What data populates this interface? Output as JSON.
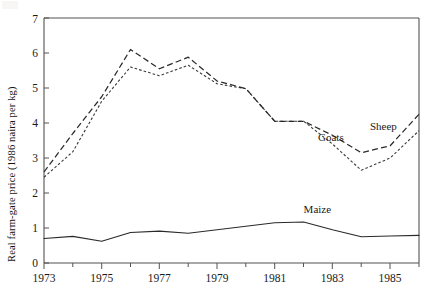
{
  "chart_data": {
    "type": "line",
    "title": "",
    "xlabel": "",
    "ylabel": "Real farm-gate price (1986 naira per kg)",
    "xlim": [
      1973,
      1986
    ],
    "ylim": [
      0,
      7
    ],
    "grid": false,
    "legend_position": "inline-annotations",
    "x": [
      1973,
      1974,
      1975,
      1976,
      1977,
      1978,
      1979,
      1980,
      1981,
      1982,
      1983,
      1984,
      1985,
      1986
    ],
    "xticks_major": [
      "1973",
      "1975",
      "1977",
      "1979",
      "1981",
      "1983",
      "1985"
    ],
    "xticks_major_values": [
      1973,
      1975,
      1977,
      1979,
      1981,
      1983,
      1985
    ],
    "xticks_minor_values": [
      1974,
      1976,
      1978,
      1980,
      1982,
      1984,
      1986
    ],
    "yticks": [
      "0",
      "1",
      "2",
      "3",
      "4",
      "5",
      "6",
      "7"
    ],
    "ytick_values": [
      0,
      1,
      2,
      3,
      4,
      5,
      6,
      7
    ],
    "series": [
      {
        "name": "Sheep",
        "style": "long-dashed",
        "color": "#2a2a2a",
        "values": [
          2.6,
          3.7,
          4.75,
          6.1,
          5.55,
          5.88,
          5.2,
          4.98,
          4.05,
          4.05,
          3.65,
          3.15,
          3.35,
          4.25
        ]
      },
      {
        "name": "Goats",
        "style": "short-dashed",
        "color": "#3a3a3a",
        "values": [
          2.45,
          3.18,
          4.62,
          5.6,
          5.35,
          5.65,
          5.12,
          4.98,
          4.05,
          4.05,
          3.4,
          2.65,
          3.0,
          3.78
        ]
      },
      {
        "name": "Maize",
        "style": "solid",
        "color": "#2a2a2a",
        "values": [
          0.7,
          0.76,
          0.62,
          0.87,
          0.91,
          0.85,
          0.95,
          1.05,
          1.15,
          1.17,
          0.95,
          0.75,
          0.77,
          0.79
        ]
      }
    ],
    "annotations": [
      {
        "text": "Sheep",
        "x": 1984.3,
        "y": 3.8
      },
      {
        "text": "Goats",
        "x": 1982.5,
        "y": 3.48
      },
      {
        "text": "Maize",
        "x": 1982.0,
        "y": 1.42
      }
    ]
  }
}
